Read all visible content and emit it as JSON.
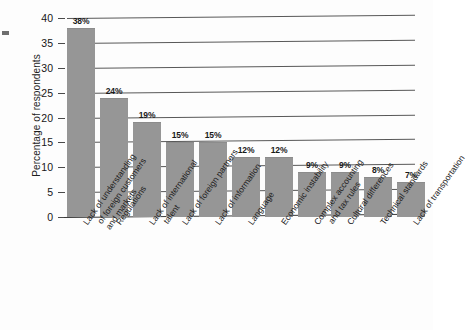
{
  "chart_data": {
    "type": "bar",
    "title": "",
    "xlabel": "",
    "ylabel": "Percentage of respondents",
    "ylim": [
      0,
      40
    ],
    "ytick_step": 5,
    "yticks": [
      "0",
      "5",
      "10",
      "15",
      "20",
      "25",
      "30",
      "35",
      "40"
    ],
    "grid": true,
    "legend": "none",
    "bar_color": "#969696",
    "categories": [
      "Lack of understanding of foreign customers and markets",
      "Regulations",
      "Lack of international talent",
      "Lack of foreign partners",
      "Lack of information",
      "Language",
      "Economic instability",
      "Complex accounting and tax rules",
      "Cultural differences",
      "Technical standards",
      "Lack of transportation"
    ],
    "category_lines": [
      [
        "Lack of understanding",
        "of foreign customers",
        "and markets"
      ],
      [
        "Regulations"
      ],
      [
        "Lack of international",
        "talent"
      ],
      [
        "Lack of foreign partners"
      ],
      [
        "Lack of information"
      ],
      [
        "Language"
      ],
      [
        "Economic instability"
      ],
      [
        "Complex accounting",
        "and tax rules"
      ],
      [
        "Cultural differences"
      ],
      [
        "Technical standards"
      ],
      [
        "Lack of transportation"
      ]
    ],
    "values": [
      38,
      24,
      19,
      15,
      15,
      12,
      12,
      9,
      9,
      8,
      7
    ],
    "value_labels": [
      "38%",
      "24%",
      "19%",
      "15%",
      "15%",
      "12%",
      "12%",
      "9%",
      "9%",
      "8%",
      "7%"
    ]
  }
}
